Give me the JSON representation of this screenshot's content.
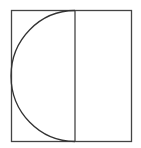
{
  "diagram": {
    "stroke_color": "#444444",
    "background": "#ffffff",
    "rect": {
      "x": 11.5,
      "y": 10.5,
      "width": 120,
      "height": 131
    },
    "divider": {
      "x": 75
    },
    "semicircle": {
      "cx": 75,
      "cy": 76,
      "rx": 64,
      "ry": 65.5
    }
  }
}
